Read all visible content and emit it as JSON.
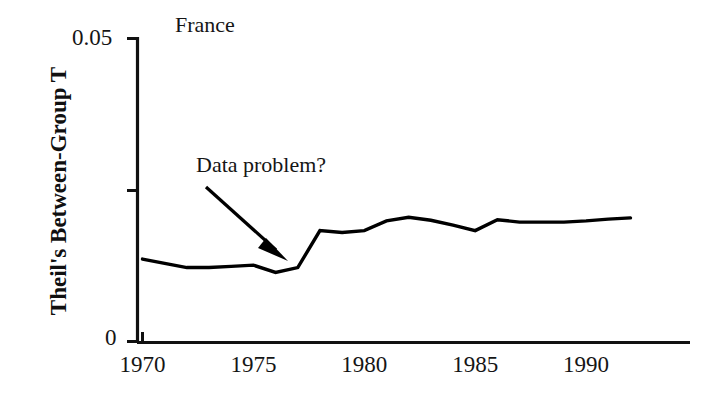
{
  "chart_data": {
    "type": "line",
    "title": "France",
    "xlabel": "",
    "ylabel": "Theil's Between-Group T",
    "xlim": [
      1970,
      1993
    ],
    "ylim": [
      0,
      0.05
    ],
    "grid": false,
    "legend_position": "none",
    "y_tick_labels": [
      "0",
      "0.05"
    ],
    "y_ticks": [
      0,
      0.025,
      0.05
    ],
    "y_ticks_labeled": [
      0,
      0.05
    ],
    "x_tick_labels": [
      "1970",
      "1975",
      "1980",
      "1985",
      "1990"
    ],
    "x_ticks": [
      1970,
      1975,
      1980,
      1985,
      1990
    ],
    "annotations": [
      {
        "text": "Data problem?",
        "arrow_from": [
          1972.9,
          0.0345
        ],
        "arrow_to": [
          1976.4,
          0.0137
        ]
      }
    ],
    "series": [
      {
        "name": "Theil's Between-Group T",
        "color": "#000000",
        "x": [
          1970,
          1971,
          1972,
          1973,
          1974,
          1975,
          1976,
          1977,
          1978,
          1979,
          1980,
          1981,
          1982,
          1983,
          1984,
          1985,
          1986,
          1987,
          1988,
          1989,
          1990,
          1991,
          1992
        ],
        "values": [
          0.0136,
          0.0129,
          0.0122,
          0.0122,
          0.0124,
          0.0126,
          0.0114,
          0.0122,
          0.0183,
          0.018,
          0.0183,
          0.0199,
          0.0205,
          0.02,
          0.0192,
          0.0183,
          0.0201,
          0.0197,
          0.0197,
          0.0197,
          0.0199,
          0.0202,
          0.0204
        ]
      }
    ]
  },
  "axis": {
    "y_label": "Theil's Between-Group T",
    "y_top_label": "0.05",
    "y_bottom_label": "0",
    "x_labels": [
      "1970",
      "1975",
      "1980",
      "1985",
      "1990"
    ]
  },
  "labels": {
    "series_title": "France",
    "annotation": "Data problem?"
  }
}
